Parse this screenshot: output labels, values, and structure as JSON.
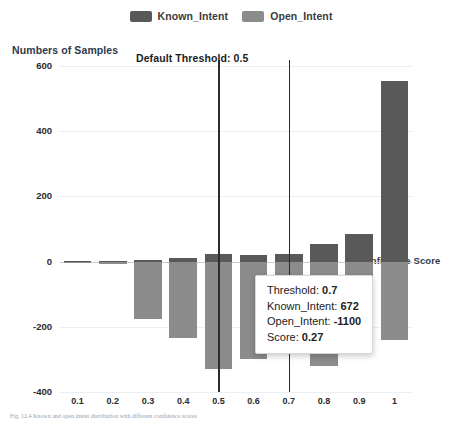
{
  "legend": {
    "items": [
      {
        "label": "Known_Intent",
        "color": "#595959",
        "icon": "legend-swatch-known-intent"
      },
      {
        "label": "Open_Intent",
        "color": "#8c8c8c",
        "icon": "legend-swatch-open-intent"
      }
    ]
  },
  "annotations": {
    "default_threshold_label": "Default Threshold: 0.5",
    "y_axis_title": "Numbers of Samples",
    "x_axis_title": "Confidence Score"
  },
  "tooltip": {
    "rows": [
      {
        "key": "Threshold:",
        "value": "0.7"
      },
      {
        "key": "Known_Intent:",
        "value": "672"
      },
      {
        "key": "Open_Intent:",
        "value": "-1100"
      },
      {
        "key": "Score:",
        "value": "0.27"
      }
    ]
  },
  "caption": {
    "text": "Fig. 12.4  Known and open intent distribution with different confidence scores"
  },
  "chart_data": {
    "type": "bar",
    "title": "",
    "xlabel": "Confidence Score",
    "ylabel": "Numbers of Samples",
    "categories": [
      "0.1",
      "0.2",
      "0.3",
      "0.4",
      "0.5",
      "0.6",
      "0.7",
      "0.8",
      "0.9",
      "1"
    ],
    "ylim": [
      -400,
      600
    ],
    "yticks": [
      -400,
      -200,
      0,
      200,
      400,
      600
    ],
    "grid": true,
    "legend_position": "top-center",
    "orientation": "diverging-vertical",
    "series": [
      {
        "name": "Known_Intent",
        "color": "#595959",
        "values": [
          2,
          3,
          6,
          12,
          22,
          20,
          24,
          55,
          85,
          554
        ]
      },
      {
        "name": "Open_Intent",
        "color": "#8c8c8c",
        "values": [
          -3,
          -8,
          -175,
          -235,
          -330,
          -300,
          -262,
          -320,
          -175,
          -240
        ]
      }
    ],
    "reference_lines": [
      {
        "x": "0.5",
        "label": "Default Threshold: 0.5",
        "color": "#2b2b2b"
      },
      {
        "x": "0.7",
        "label": "",
        "color": "#2b2b2b"
      }
    ]
  }
}
